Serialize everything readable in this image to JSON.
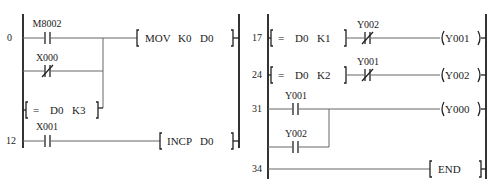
{
  "diagram_type": "PLC ladder diagram",
  "left_program": {
    "rungs": [
      {
        "step": "0",
        "contacts": [
          {
            "label": "M8002",
            "type": "normally-open"
          },
          {
            "label": "X000",
            "type": "normally-closed",
            "parallel": true
          },
          {
            "compare": {
              "op": "=",
              "a": "D0",
              "b": "K3"
            },
            "parallel": true
          }
        ],
        "instruction": {
          "op": "MOV",
          "args": [
            "K0",
            "D0"
          ]
        }
      },
      {
        "step": "12",
        "contacts": [
          {
            "label": "X001",
            "type": "normally-open"
          }
        ],
        "instruction": {
          "op": "INCP",
          "args": [
            "D0"
          ]
        }
      }
    ]
  },
  "right_program": {
    "rungs": [
      {
        "step": "17",
        "compare": {
          "op": "=",
          "a": "D0",
          "b": "K1"
        },
        "contacts": [
          {
            "label": "Y002",
            "type": "normally-closed"
          }
        ],
        "coil": "Y001"
      },
      {
        "step": "24",
        "compare": {
          "op": "=",
          "a": "D0",
          "b": "K2"
        },
        "contacts": [
          {
            "label": "Y001",
            "type": "normally-closed"
          }
        ],
        "coil": "Y002"
      },
      {
        "step": "31",
        "contacts": [
          {
            "label": "Y001",
            "type": "normally-open"
          },
          {
            "label": "Y002",
            "type": "normally-open",
            "parallel": true
          }
        ],
        "coil": "Y000"
      },
      {
        "step": "34",
        "instruction": {
          "op": "END",
          "args": []
        }
      }
    ]
  }
}
